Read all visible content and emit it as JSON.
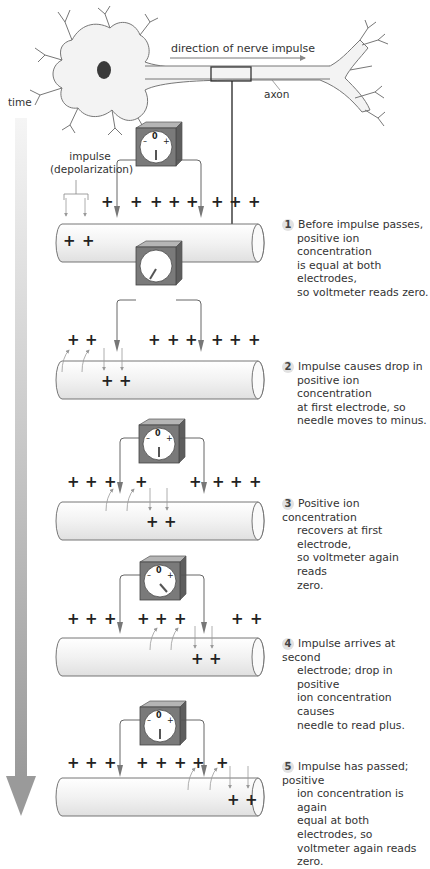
{
  "header": {
    "impulse_direction_label": "direction of nerve impulse",
    "axon_label": "axon"
  },
  "time_axis": {
    "label": "time"
  },
  "impulse_label": {
    "line1": "impulse",
    "line2": "(depolarization)"
  },
  "voltmeter": {
    "zero": "0",
    "minus": "–",
    "plus": "+"
  },
  "steps": [
    {
      "number": "1",
      "lines": [
        "Before impulse passes,",
        "positive ion concentration",
        "is equal at both electrodes,",
        "so voltmeter reads zero."
      ],
      "needle": "zero"
    },
    {
      "number": "2",
      "lines": [
        "Impulse causes drop in",
        "positive ion concentration",
        "at first electrode, so",
        "needle moves to minus."
      ],
      "needle": "minus"
    },
    {
      "number": "3",
      "lines": [
        "Positive ion concentration",
        "recovers at first electrode,",
        "so voltmeter again reads",
        "zero."
      ],
      "needle": "zero"
    },
    {
      "number": "4",
      "lines": [
        "Impulse arrives at second",
        "electrode; drop in positive",
        "ion concentration causes",
        "needle to read plus."
      ],
      "needle": "plus"
    },
    {
      "number": "5",
      "lines": [
        "Impulse has passed; positive",
        "ion concentration is again",
        "equal at both electrodes, so",
        "voltmeter again reads zero."
      ],
      "needle": "zero"
    }
  ],
  "colors": {
    "meter_body": "#7a7a7a",
    "meter_top": "#b5b5b5",
    "time_arrow": "#a0a0a0",
    "axon_fill": "#f0f0f0"
  }
}
